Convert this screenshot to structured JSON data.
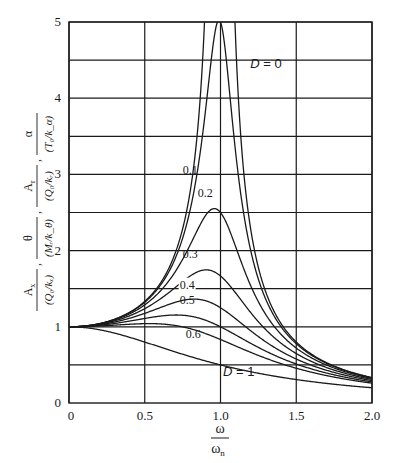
{
  "chart_data": {
    "type": "line",
    "title": "",
    "xlabel": "ω / ω_n",
    "ylabel": "A_x/(Q_0/k_x), θ/(M_r/k_θ), A_r/(Q_0/k_r), α/(T_0/k_α)",
    "xlim": [
      0,
      2.0
    ],
    "ylim": [
      0,
      5
    ],
    "grid": true,
    "legend": "inline curve labels",
    "x_ticks": [
      "0",
      "0.5",
      "1.0",
      "1.5",
      "2.0"
    ],
    "y_ticks": [
      "0",
      "1",
      "2",
      "3",
      "4",
      "5"
    ],
    "y_gridlines": [
      0.5,
      1,
      1.5,
      2,
      2.5,
      3,
      3.5,
      4,
      4.5,
      5
    ],
    "x": [
      0,
      0.1,
      0.2,
      0.3,
      0.4,
      0.5,
      0.6,
      0.7,
      0.8,
      0.85,
      0.9,
      0.95,
      1.0,
      1.05,
      1.1,
      1.15,
      1.2,
      1.3,
      1.4,
      1.5,
      1.6,
      1.7,
      1.8,
      1.9,
      2.0
    ],
    "series": [
      {
        "name": "D = 0",
        "label": "D = 0",
        "values": [
          1.0,
          1.01,
          1.04,
          1.1,
          1.19,
          1.33,
          1.56,
          1.96,
          2.78,
          3.6,
          5.0,
          5.0,
          5.0,
          5.0,
          4.76,
          3.1,
          2.27,
          1.45,
          1.04,
          0.8,
          0.64,
          0.53,
          0.45,
          0.38,
          0.33
        ]
      },
      {
        "name": "D = 0.1",
        "label": "0.1",
        "values": [
          1.0,
          1.01,
          1.04,
          1.1,
          1.19,
          1.32,
          1.53,
          1.88,
          2.55,
          3.13,
          4.02,
          4.8,
          5.0,
          4.32,
          3.39,
          2.64,
          2.1,
          1.41,
          1.03,
          0.79,
          0.64,
          0.53,
          0.44,
          0.38,
          0.33
        ]
      },
      {
        "name": "D = 0.2",
        "label": "0.2",
        "values": [
          1.0,
          1.01,
          1.03,
          1.09,
          1.17,
          1.27,
          1.42,
          1.63,
          1.94,
          2.15,
          2.38,
          2.54,
          2.5,
          2.27,
          1.95,
          1.66,
          1.41,
          1.06,
          0.83,
          0.67,
          0.56,
          0.47,
          0.4,
          0.35,
          0.31
        ]
      },
      {
        "name": "D = 0.3",
        "label": "0.3",
        "values": [
          1.0,
          1.01,
          1.03,
          1.07,
          1.13,
          1.2,
          1.3,
          1.43,
          1.58,
          1.66,
          1.72,
          1.74,
          1.67,
          1.55,
          1.4,
          1.27,
          1.14,
          0.92,
          0.75,
          0.62,
          0.52,
          0.45,
          0.39,
          0.34,
          0.3
        ]
      },
      {
        "name": "D = 0.4",
        "label": "0.4",
        "values": [
          1.0,
          1.01,
          1.02,
          1.05,
          1.09,
          1.13,
          1.19,
          1.26,
          1.32,
          1.35,
          1.36,
          1.34,
          1.25,
          1.19,
          1.1,
          1.02,
          0.94,
          0.8,
          0.67,
          0.57,
          0.49,
          0.42,
          0.37,
          0.32,
          0.29
        ]
      },
      {
        "name": "D = 0.5",
        "label": "0.5",
        "values": [
          1.0,
          1.0,
          1.01,
          1.03,
          1.05,
          1.07,
          1.1,
          1.13,
          1.14,
          1.14,
          1.13,
          1.1,
          1.0,
          0.96,
          0.91,
          0.86,
          0.81,
          0.7,
          0.61,
          0.53,
          0.46,
          0.4,
          0.35,
          0.31,
          0.28
        ]
      },
      {
        "name": "D = 0.6",
        "label": "0.6",
        "values": [
          1.0,
          1.0,
          1.0,
          1.01,
          1.02,
          1.03,
          1.03,
          1.03,
          1.01,
          0.99,
          0.96,
          0.92,
          0.83,
          0.8,
          0.77,
          0.74,
          0.7,
          0.63,
          0.55,
          0.49,
          0.43,
          0.38,
          0.34,
          0.3,
          0.27
        ]
      },
      {
        "name": "D = 1",
        "label": "D = 1",
        "values": [
          1.0,
          0.99,
          0.96,
          0.92,
          0.86,
          0.8,
          0.74,
          0.67,
          0.61,
          0.58,
          0.55,
          0.53,
          0.5,
          0.48,
          0.45,
          0.43,
          0.41,
          0.37,
          0.34,
          0.31,
          0.28,
          0.26,
          0.24,
          0.22,
          0.2
        ]
      }
    ],
    "annotations": [
      {
        "text": "D = 0",
        "x": 1.3,
        "y": 4.4
      },
      {
        "text": "0.1",
        "x": 0.8,
        "y": 3.0
      },
      {
        "text": "0.2",
        "x": 0.9,
        "y": 2.7
      },
      {
        "text": "0.3",
        "x": 0.8,
        "y": 1.9
      },
      {
        "text": "0.4",
        "x": 0.78,
        "y": 1.5
      },
      {
        "text": "0.5",
        "x": 0.78,
        "y": 1.3
      },
      {
        "text": "0.6",
        "x": 0.82,
        "y": 0.85
      },
      {
        "text": "D = 1",
        "x": 1.12,
        "y": 0.35
      }
    ]
  },
  "axes": {
    "x_label_num": "ω",
    "x_label_den": "ω",
    "x_label_den_sub": "n",
    "y_label_parts": [
      {
        "num": "A",
        "num_sub": "x",
        "den": "(Q₀/kₓ)"
      },
      {
        "num": "θ",
        "num_sub": "",
        "den": "(Mᵣ/k_θ)"
      },
      {
        "num": "A",
        "num_sub": "r",
        "den": "(Q₀/kᵣ)"
      },
      {
        "num": "α",
        "num_sub": "",
        "den": "(T₀/k_α)"
      }
    ]
  }
}
